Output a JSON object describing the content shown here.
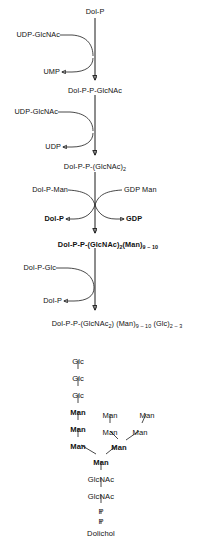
{
  "figure": {
    "stroke_color": "#1a1a1a",
    "background_color": "#ffffff"
  },
  "pathway": {
    "start_label": "Dol-P",
    "steps": [
      {
        "id": "step-1",
        "substrate_in": "UDP-GlcNAc",
        "product_out": "UMP",
        "result": "Dol-P-P-GlcNAc",
        "result_bold": false
      },
      {
        "id": "step-2",
        "substrate_in": "UDP-GlcNAc",
        "product_out": "UDP",
        "result_prefix": "Dol-P-P-(GlcNAc)",
        "result_sub": "2",
        "result_bold": false
      },
      {
        "id": "step-3",
        "substrate_in_left": "Dol-P-Man",
        "substrate_in_right": "GDP Man",
        "product_out_left": "Dol-P",
        "product_out_right": "GDP",
        "result_bold": true
      },
      {
        "id": "step-4",
        "substrate_in": "Dol-P-Glc",
        "product_out": "Dol-P",
        "result_bold": false
      }
    ],
    "product_3": {
      "part1": "Dol-P-P-(GlcNAc)",
      "sub1": "2",
      "part2": "(Man)",
      "sub2": "9 – 10"
    },
    "product_4": {
      "part1": "Dol-P-P-(GlcNAc",
      "sub1": "2",
      "part2": ") (Man)",
      "sub2": "9 – 10",
      "part3": " (Glc)",
      "sub3": "2 – 3"
    }
  },
  "structure": {
    "name": "oligosaccharide-tree",
    "nodes": [
      {
        "id": "glc-1",
        "label": "Glc",
        "bold": false,
        "x": 78,
        "y": 358
      },
      {
        "id": "glc-2",
        "label": "Glc",
        "bold": false,
        "x": 78,
        "y": 375
      },
      {
        "id": "glc-3",
        "label": "Glc",
        "bold": false,
        "x": 78,
        "y": 392
      },
      {
        "id": "man-a1",
        "label": "Man",
        "bold": true,
        "x": 78,
        "y": 409
      },
      {
        "id": "man-a2",
        "label": "Man",
        "bold": true,
        "x": 78,
        "y": 426
      },
      {
        "id": "man-a3",
        "label": "Man",
        "bold": true,
        "x": 78,
        "y": 443
      },
      {
        "id": "man-b1",
        "label": "Man",
        "bold": false,
        "x": 110,
        "y": 412
      },
      {
        "id": "man-b2",
        "label": "Man",
        "bold": false,
        "x": 110,
        "y": 429
      },
      {
        "id": "man-c1",
        "label": "Man",
        "bold": false,
        "x": 147,
        "y": 412
      },
      {
        "id": "man-c2",
        "label": "Man",
        "bold": false,
        "x": 140,
        "y": 429
      },
      {
        "id": "man-core",
        "label": "Man",
        "bold": true,
        "x": 119,
        "y": 444
      },
      {
        "id": "man-base",
        "label": "Man",
        "bold": true,
        "x": 101,
        "y": 459
      },
      {
        "id": "glcnac-1",
        "label": "GlcNAc",
        "bold": false,
        "x": 101,
        "y": 476
      },
      {
        "id": "glcnac-2",
        "label": "GlcNAc",
        "bold": false,
        "x": 101,
        "y": 493
      },
      {
        "id": "p-1",
        "label": "P",
        "bold": false,
        "x": 101,
        "y": 508
      },
      {
        "id": "p-2",
        "label": "P",
        "bold": false,
        "x": 101,
        "y": 518
      },
      {
        "id": "dolichol",
        "label": "Dolichol",
        "bold": false,
        "x": 101,
        "y": 530
      }
    ]
  }
}
